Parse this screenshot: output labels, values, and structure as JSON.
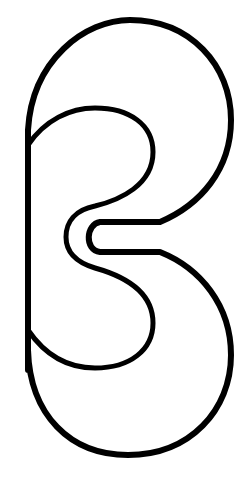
{
  "figure": {
    "description": "Black outline drawing of a stylized B-like shape with a horizontal notch on the right-center",
    "colors": {
      "background": "#ffffff",
      "stroke": "#000000"
    },
    "stroke_width": 6,
    "dimensions": {
      "width": 243,
      "height": 485
    }
  }
}
